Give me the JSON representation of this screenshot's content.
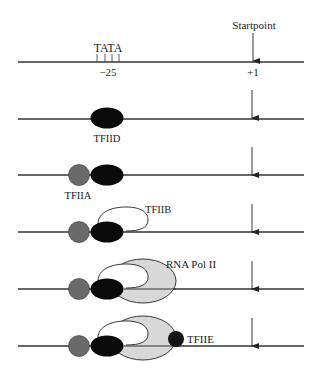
{
  "diagram": {
    "title": "",
    "colors": {
      "dna": "#333333",
      "tfiid": "#0a0a0a",
      "tfiia": "#6a6a6a",
      "tfiib": "#ffffff",
      "polii": "#d8d8d8",
      "tfiie": "#151515",
      "arrow": "#222222"
    },
    "row1": {
      "startpoint_label": "Startpoint",
      "tata_label": "TATA",
      "minus25_label": "−25",
      "plus1_label": "+1"
    },
    "labels": {
      "tfiid": "TFIID",
      "tfiia": "TFIIA",
      "tfiib": "TFIIB",
      "polii": "RNA Pol II",
      "tfiie": "TFIIE"
    },
    "steps": [
      {
        "index": 1,
        "components": []
      },
      {
        "index": 2,
        "components": [
          "TFIID"
        ]
      },
      {
        "index": 3,
        "components": [
          "TFIIA",
          "TFIID"
        ]
      },
      {
        "index": 4,
        "components": [
          "TFIIA",
          "TFIID",
          "TFIIB"
        ]
      },
      {
        "index": 5,
        "components": [
          "TFIIA",
          "TFIID",
          "TFIIB",
          "RNA Pol II"
        ]
      },
      {
        "index": 6,
        "components": [
          "TFIIA",
          "TFIID",
          "TFIIB",
          "RNA Pol II",
          "TFIIE"
        ]
      }
    ]
  }
}
